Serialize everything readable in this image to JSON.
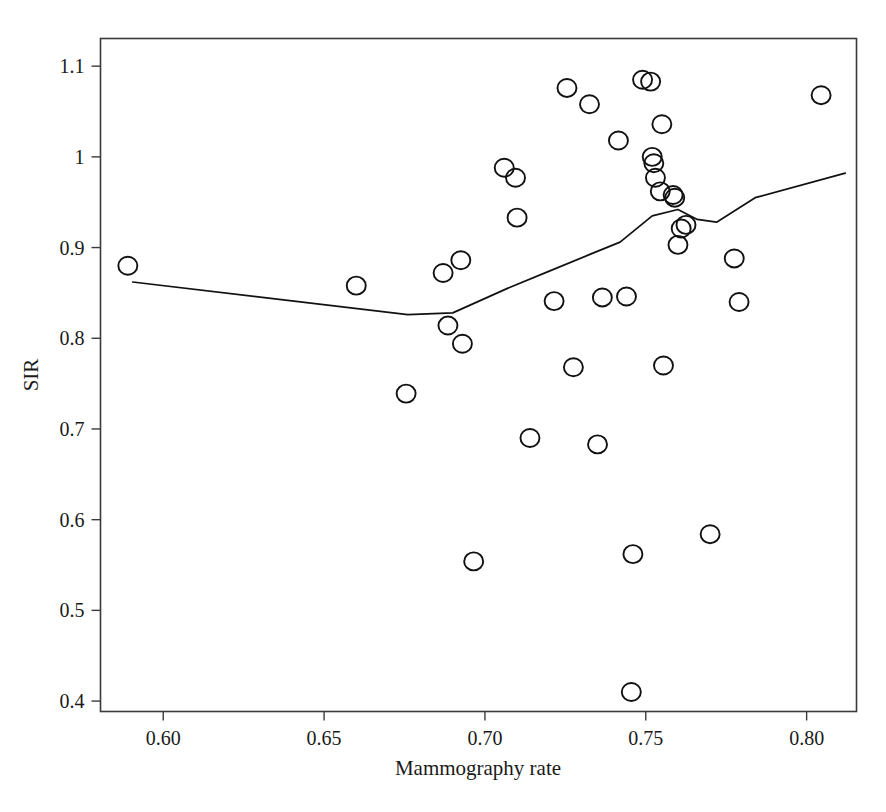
{
  "figure": {
    "background_color": "#ffffff",
    "ink_color": "#111111",
    "axis_color": "#3a3a3a"
  },
  "chart_data": {
    "type": "scatter",
    "title": "",
    "xlabel": "Mammography rate",
    "ylabel": "SIR",
    "xlim": [
      0.5805,
      0.8155
    ],
    "ylim": [
      0.3885,
      1.1305
    ],
    "grid": false,
    "legend": null,
    "xticks": [
      0.6,
      0.65,
      0.7,
      0.75,
      0.8
    ],
    "xticklabels": [
      "0.60",
      "0.65",
      "0.70",
      "0.75",
      "0.80"
    ],
    "yticks": [
      0.4,
      0.5,
      0.6,
      0.7,
      0.8,
      0.9,
      1.0,
      1.1
    ],
    "yticklabels": [
      "0.4",
      "0.5",
      "0.6",
      "0.7",
      "0.8",
      "0.9",
      "1",
      "1.1"
    ],
    "marker": "open-circle",
    "points": [
      {
        "x": 0.589,
        "y": 0.88
      },
      {
        "x": 0.66,
        "y": 0.858
      },
      {
        "x": 0.6755,
        "y": 0.739
      },
      {
        "x": 0.687,
        "y": 0.872
      },
      {
        "x": 0.6885,
        "y": 0.814
      },
      {
        "x": 0.6925,
        "y": 0.886
      },
      {
        "x": 0.693,
        "y": 0.794
      },
      {
        "x": 0.6965,
        "y": 0.554
      },
      {
        "x": 0.706,
        "y": 0.988
      },
      {
        "x": 0.7095,
        "y": 0.977
      },
      {
        "x": 0.71,
        "y": 0.933
      },
      {
        "x": 0.714,
        "y": 0.69
      },
      {
        "x": 0.7215,
        "y": 0.841
      },
      {
        "x": 0.7255,
        "y": 1.076
      },
      {
        "x": 0.7275,
        "y": 0.768
      },
      {
        "x": 0.7325,
        "y": 1.058
      },
      {
        "x": 0.735,
        "y": 0.683
      },
      {
        "x": 0.7365,
        "y": 0.845
      },
      {
        "x": 0.7415,
        "y": 1.018
      },
      {
        "x": 0.744,
        "y": 0.846
      },
      {
        "x": 0.7455,
        "y": 0.41
      },
      {
        "x": 0.746,
        "y": 0.562
      },
      {
        "x": 0.749,
        "y": 1.085
      },
      {
        "x": 0.7515,
        "y": 1.083
      },
      {
        "x": 0.752,
        "y": 1.0
      },
      {
        "x": 0.7525,
        "y": 0.993
      },
      {
        "x": 0.753,
        "y": 0.977
      },
      {
        "x": 0.7545,
        "y": 0.962
      },
      {
        "x": 0.755,
        "y": 1.036
      },
      {
        "x": 0.7555,
        "y": 0.77
      },
      {
        "x": 0.7585,
        "y": 0.958
      },
      {
        "x": 0.759,
        "y": 0.955
      },
      {
        "x": 0.76,
        "y": 0.903
      },
      {
        "x": 0.761,
        "y": 0.921
      },
      {
        "x": 0.7625,
        "y": 0.925
      },
      {
        "x": 0.77,
        "y": 0.584
      },
      {
        "x": 0.7775,
        "y": 0.888
      },
      {
        "x": 0.779,
        "y": 0.84
      },
      {
        "x": 0.8045,
        "y": 1.068
      }
    ],
    "series": [
      {
        "name": "smoothed-trend",
        "type": "line",
        "x": [
          0.5905,
          0.676,
          0.69,
          0.707,
          0.72,
          0.733,
          0.742,
          0.752,
          0.76,
          0.766,
          0.772,
          0.784,
          0.812
        ],
        "y": [
          0.862,
          0.826,
          0.828,
          0.855,
          0.874,
          0.893,
          0.906,
          0.935,
          0.942,
          0.931,
          0.928,
          0.955,
          0.982
        ]
      }
    ]
  },
  "axes": {
    "x_title": "Mammography rate",
    "y_title": "SIR"
  }
}
